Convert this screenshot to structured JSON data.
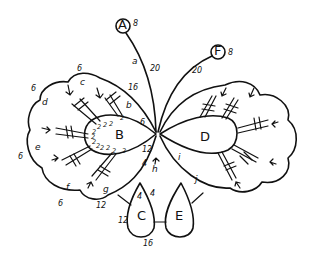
{
  "diagram": {
    "type": "tatting-pattern",
    "rings": {
      "A": {
        "label": "A",
        "count": "8"
      },
      "B": {
        "label": "B"
      },
      "C": {
        "label": "C",
        "counts": [
          "4",
          "4",
          "12",
          "16"
        ]
      },
      "D": {
        "label": "D"
      },
      "E": {
        "label": "E"
      },
      "F": {
        "label": "F",
        "count": "8"
      }
    },
    "chains": {
      "a": {
        "label": "a",
        "count": "20"
      },
      "f_chain": {
        "count": "20"
      },
      "b": {
        "label": "b",
        "count": "16"
      },
      "c": {
        "label": "c",
        "count": "6"
      },
      "d": {
        "label": "d",
        "count": "6"
      },
      "e": {
        "label": "e",
        "count": "6"
      },
      "f": {
        "label": "f",
        "count": "6"
      },
      "g": {
        "label": "g",
        "count": "12"
      },
      "h": {
        "label": "h",
        "count": "4"
      },
      "i": {
        "label": "i"
      },
      "j": {
        "label": "j"
      }
    },
    "ring_b_counts": [
      "2",
      "2",
      "2",
      "2",
      "2",
      "2",
      "2",
      "2",
      "2",
      "2",
      "2",
      "6",
      "12",
      "2",
      "4"
    ]
  }
}
